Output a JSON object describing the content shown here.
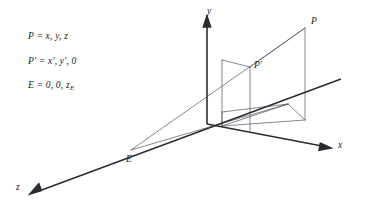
{
  "figure": {
    "type": "perspective-projection-diagram",
    "background_color": "#ffffff",
    "line_color": "#3a3a4a",
    "axis_color": "#2b2b33",
    "text_color": "#1a1a1a"
  },
  "equations": [
    {
      "id": "point-P",
      "lhs": "P",
      "rhs": "x, y, z",
      "text": "P = x, y, z"
    },
    {
      "id": "point-P-prime",
      "lhs": "P'",
      "rhs": "x', y', 0",
      "text": "P' = x', y', 0"
    },
    {
      "id": "point-E",
      "lhs": "E",
      "rhs": "0, 0, z",
      "sub": "E",
      "text": "E = 0, 0, z"
    }
  ],
  "labels": {
    "P": "P",
    "P_prime": "P'",
    "E": "E"
  },
  "axes": [
    {
      "name": "x-axis",
      "label": "x",
      "direction": "right-downward"
    },
    {
      "name": "y-axis",
      "label": "y",
      "direction": "up"
    },
    {
      "name": "z-axis",
      "label": "z",
      "direction": "left-downward"
    }
  ],
  "geometry": {
    "eye_point": {
      "name": "E",
      "x": 131,
      "y": 150
    },
    "origin": {
      "name": "O",
      "x": 207,
      "y": 124
    },
    "point_P": {
      "name": "P",
      "x": 305,
      "y": 28
    },
    "point_P_prime": {
      "name": "P'",
      "x": 250,
      "y": 67
    }
  }
}
